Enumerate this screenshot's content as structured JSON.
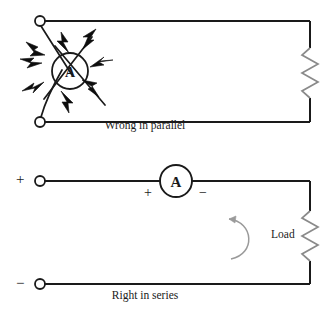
{
  "figure": {
    "kind": "circuit-diagram",
    "background_color": "#ffffff",
    "line_color": "#1a1a1a",
    "resistor_color": "#777777",
    "arrow_color": "#888888"
  },
  "top_circuit": {
    "caption": "Wrong in parallel",
    "meter_letter": "A",
    "meter_state": "exploding",
    "terminal_top": "open-terminal",
    "terminal_bottom": "open-terminal",
    "load_symbol": "resistor-zigzag",
    "spark_count": 8,
    "broken_wire_count": 4
  },
  "bottom_circuit": {
    "caption": "Right in series",
    "meter_letter": "A",
    "terminal_plus": "+",
    "terminal_minus": "−",
    "ammeter_plus": "+",
    "ammeter_minus": "−",
    "load_label": "Load",
    "load_symbol": "resistor-zigzag",
    "current_arrow": "curved-arrow-counterclockwise"
  }
}
